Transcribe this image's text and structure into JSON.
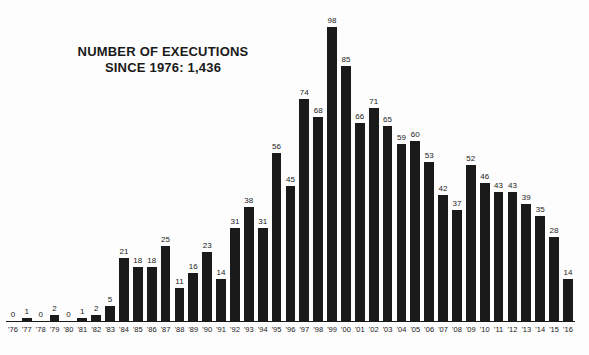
{
  "title": {
    "line1": "NUMBER OF EXECUTIONS",
    "line2": "SINCE 1976: 1,436"
  },
  "colors": {
    "bar": "#1a1a1a",
    "text": "#1a1a1a",
    "background": "#fdfdfd"
  },
  "chart_data": {
    "type": "bar",
    "title": "NUMBER OF EXECUTIONS SINCE 1976: 1,436",
    "xlabel": "",
    "ylabel": "",
    "ylim": [
      0,
      100
    ],
    "grid": false,
    "legend": false,
    "data_labels": true,
    "total": "1,436",
    "categories": [
      "'76",
      "'77",
      "'78",
      "'79",
      "'80",
      "'81",
      "'82",
      "'83",
      "'84",
      "'85",
      "'86",
      "'87",
      "'88",
      "'89",
      "'90",
      "'91",
      "'92",
      "'93",
      "'94",
      "'95",
      "'96",
      "'97",
      "'98",
      "'99",
      "'00",
      "'01",
      "'02",
      "'03",
      "'04",
      "'05",
      "'06",
      "'07",
      "'08",
      "'09",
      "'10",
      "'11",
      "'12",
      "'13",
      "'14",
      "'15",
      "'16"
    ],
    "values": [
      0,
      1,
      0,
      2,
      0,
      1,
      2,
      5,
      21,
      18,
      18,
      25,
      11,
      16,
      23,
      14,
      31,
      38,
      31,
      56,
      45,
      74,
      68,
      98,
      85,
      66,
      71,
      65,
      59,
      60,
      53,
      42,
      37,
      52,
      46,
      43,
      43,
      39,
      35,
      28,
      14
    ]
  }
}
